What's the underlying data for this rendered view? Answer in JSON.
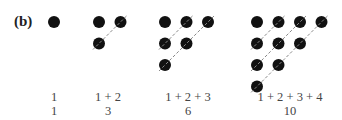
{
  "figure": {
    "label": "(b)",
    "groups": [
      {
        "n": 1,
        "sum_expr": "1",
        "total": "1",
        "center_x": 54
      },
      {
        "n": 2,
        "sum_expr": "1 + 2",
        "total": "3",
        "center_x": 108
      },
      {
        "n": 3,
        "sum_expr": "1 + 2 + 3",
        "total": "6",
        "center_x": 188
      },
      {
        "n": 4,
        "sum_expr": "1 + 2 + 3 + 4",
        "total": "10",
        "center_x": 290
      }
    ],
    "dot_color": "#111111",
    "dash_color": "#888888"
  }
}
